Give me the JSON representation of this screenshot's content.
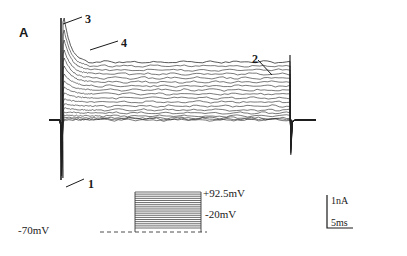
{
  "figure": {
    "panel_letter": "A",
    "width": 407,
    "height": 256,
    "background": "#ffffff",
    "trace_color": "#202020",
    "protocol_color": "#3a3a3a"
  },
  "markers": [
    {
      "id": "marker-1",
      "label": "1",
      "x": 88,
      "y": 178,
      "leader": {
        "x1": 66,
        "y1": 187,
        "x2": 84,
        "y2": 179
      }
    },
    {
      "id": "marker-2",
      "label": "2",
      "x": 252,
      "y": 53,
      "leader": {
        "x1": 258,
        "y1": 60,
        "x2": 272,
        "y2": 75
      }
    },
    {
      "id": "marker-3",
      "label": "3",
      "x": 85,
      "y": 13,
      "leader": {
        "x1": 63,
        "y1": 24,
        "x2": 82,
        "y2": 17
      }
    },
    {
      "id": "marker-4",
      "label": "4",
      "x": 121,
      "y": 37,
      "leader": {
        "x1": 90,
        "y1": 50,
        "x2": 118,
        "y2": 41
      }
    }
  ],
  "protocol": {
    "holding_label": "-70mV",
    "top_label": "+92.5mV",
    "bottom_label": "-20mV",
    "holding_label_pos": {
      "x": 18,
      "y": 225
    },
    "top_label_pos": {
      "x": 203,
      "y": 188
    },
    "bottom_label_pos": {
      "x": 205,
      "y": 209
    },
    "box": {
      "x": 135,
      "y": 192,
      "width": 66,
      "height": 37
    },
    "baseline": {
      "x1": 100,
      "x2": 207,
      "y": 232
    },
    "n_steps": 18
  },
  "scalebar": {
    "current_label": "1nA",
    "time_label": "5ms",
    "origin": {
      "x": 327,
      "y": 228
    },
    "vertical_height": 33,
    "horizontal_width": 26,
    "current_label_pos": {
      "x": 331,
      "y": 196
    },
    "time_label_pos": {
      "x": 331,
      "y": 218
    }
  },
  "chart_data": {
    "type": "line",
    "title": "",
    "xlabel": "",
    "ylabel": "",
    "axis": {
      "baseline_y": 120,
      "step_on_x": 61,
      "step_off_x": 290,
      "trace_end_x": 316,
      "y_per_nA": 33,
      "x_per_ms": 26
    },
    "series": [
      {
        "name": "+92.5mV",
        "peak_y": 18,
        "plateau_y": 62,
        "inward_y": 176,
        "decay_ms": 4.0,
        "sag": 4
      },
      {
        "name": "+86mV",
        "peak_y": 30,
        "plateau_y": 66,
        "inward_y": 174,
        "decay_ms": 4.2,
        "sag": 4
      },
      {
        "name": "+79mV",
        "peak_y": 40,
        "plateau_y": 70,
        "inward_y": 172,
        "decay_ms": 4.4,
        "sag": 3
      },
      {
        "name": "+73mV",
        "peak_y": 50,
        "plateau_y": 74,
        "inward_y": 170,
        "decay_ms": 4.6,
        "sag": 3
      },
      {
        "name": "+66mV",
        "peak_y": 58,
        "plateau_y": 78,
        "inward_y": 168,
        "decay_ms": 4.8,
        "sag": 3
      },
      {
        "name": "+59mV",
        "peak_y": 66,
        "plateau_y": 82,
        "inward_y": 166,
        "decay_ms": 5.0,
        "sag": 2
      },
      {
        "name": "+53mV",
        "peak_y": 74,
        "plateau_y": 86,
        "inward_y": 164,
        "decay_ms": 5.2,
        "sag": 2
      },
      {
        "name": "+46mV",
        "peak_y": 81,
        "plateau_y": 90,
        "inward_y": 162,
        "decay_ms": 5.4,
        "sag": 2
      },
      {
        "name": "+39mV",
        "peak_y": 87,
        "plateau_y": 94,
        "inward_y": 160,
        "decay_ms": 5.6,
        "sag": 2
      },
      {
        "name": "+33mV",
        "peak_y": 93,
        "plateau_y": 98,
        "inward_y": 158,
        "decay_ms": 5.8,
        "sag": 1
      },
      {
        "name": "+26mV",
        "peak_y": 99,
        "plateau_y": 102,
        "inward_y": 155,
        "decay_ms": 6.0,
        "sag": 1
      },
      {
        "name": "+19mV",
        "peak_y": 104,
        "plateau_y": 106,
        "inward_y": 152,
        "decay_ms": 6.2,
        "sag": 1
      },
      {
        "name": "+13mV",
        "peak_y": 108,
        "plateau_y": 110,
        "inward_y": 148,
        "decay_ms": 6.4,
        "sag": 1
      },
      {
        "name": "+6mV",
        "peak_y": 112,
        "plateau_y": 113,
        "inward_y": 143,
        "decay_ms": 6.6,
        "sag": 0
      },
      {
        "name": "0mV",
        "peak_y": 115,
        "plateau_y": 116,
        "inward_y": 137,
        "decay_ms": 6.8,
        "sag": 0
      },
      {
        "name": "-7mV",
        "peak_y": 117,
        "plateau_y": 118,
        "inward_y": 131,
        "decay_ms": 7.0,
        "sag": 0
      },
      {
        "name": "-13mV",
        "peak_y": 119,
        "plateau_y": 119,
        "inward_y": 126,
        "decay_ms": 7.0,
        "sag": 0
      },
      {
        "name": "-20mV",
        "peak_y": 120,
        "plateau_y": 120,
        "inward_y": 122,
        "decay_ms": 7.0,
        "sag": 0
      }
    ]
  }
}
